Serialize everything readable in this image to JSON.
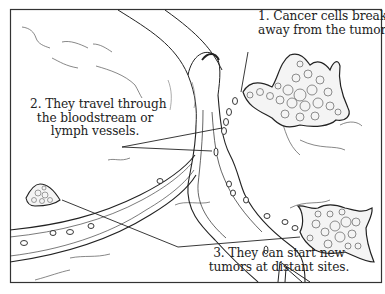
{
  "diagram": {
    "labels": [
      {
        "id": "1",
        "lines": [
          "1. Cancer cells break",
          "away from the tumor."
        ]
      },
      {
        "id": "2",
        "lines": [
          "2. They travel through",
          "the bloodstream or",
          "lymph vessels."
        ]
      },
      {
        "id": "3",
        "lines": [
          "3. They can start new",
          "tumors at distant sites."
        ]
      }
    ],
    "colors": {
      "ink": "#222222",
      "background": "#ffffff",
      "frame": "#333333"
    }
  }
}
